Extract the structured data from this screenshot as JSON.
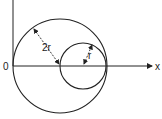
{
  "diagram": {
    "labels": {
      "origin": "0",
      "x_axis": "x",
      "big_radius": "2r",
      "small_radius": "r"
    },
    "big_circle": {
      "cx": 60,
      "cy": 66,
      "r": 47
    },
    "small_circle": {
      "cx": 83,
      "cy": 66,
      "r": 23
    },
    "colors": {
      "stroke": "#222222",
      "background": "#ffffff"
    }
  }
}
